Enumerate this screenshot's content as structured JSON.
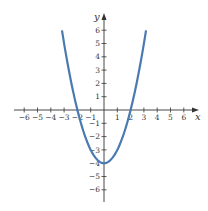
{
  "chart_data": {
    "type": "line",
    "title": "",
    "xlabel": "x",
    "ylabel": "y",
    "function": "y = x^2 - 4",
    "xlim": [
      -6.5,
      6.9
    ],
    "ylim": [
      -6.9,
      7.2
    ],
    "x_ticks": [
      -6,
      -5,
      -4,
      -3,
      -2,
      -1,
      1,
      2,
      3,
      4,
      5,
      6
    ],
    "y_ticks": [
      -6,
      -5,
      -4,
      -3,
      -2,
      -1,
      1,
      2,
      3,
      4,
      5,
      6
    ],
    "grid": false,
    "legend": null,
    "series": [
      {
        "name": "parabola",
        "color": "#4a7ab0",
        "x": [
          -3.16,
          -3,
          -2.5,
          -2,
          -1.5,
          -1,
          -0.5,
          0,
          0.5,
          1,
          1.5,
          2,
          2.5,
          3,
          3.16
        ],
        "y": [
          6,
          5,
          2.25,
          0,
          -1.75,
          -3,
          -3.75,
          -4,
          -3.75,
          -3,
          -1.75,
          0,
          2.25,
          5,
          6
        ]
      }
    ],
    "key_points": {
      "vertex": [
        0,
        -4
      ],
      "x_intercepts": [
        [
          -2,
          0
        ],
        [
          2,
          0
        ]
      ],
      "y_intercept": [
        0,
        -4
      ]
    }
  },
  "axes": {
    "x_label": "x",
    "y_label": "y",
    "axis_color": "#333333",
    "curve_color": "#4a7ab0"
  }
}
